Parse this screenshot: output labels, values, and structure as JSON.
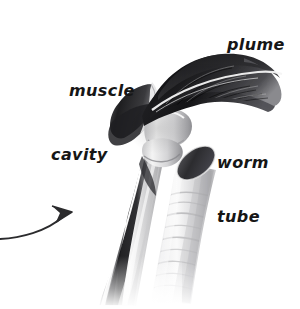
{
  "figure": {
    "kind": "pencil-illustration",
    "background_color": "#ffffff",
    "ink_color": "#161616",
    "width": 300,
    "height": 309
  },
  "labels": {
    "plume": "plume",
    "muscle": "muscle",
    "worm_tube_line1": "worm",
    "worm_tube_line2": "tube",
    "cavity": "cavity"
  },
  "icons": {
    "pointer": "curved-arrow-icon"
  },
  "parts": {
    "plume": {
      "name": "plume",
      "tone": "dark",
      "fill_dark": "#1d1d1f",
      "fill_mid": "#4a4a4d",
      "description": "dark feathery crown curving to the right"
    },
    "muscle": {
      "name": "muscle",
      "tone": "dark-mid",
      "fill_dark": "#2a2a2c",
      "fill_mid": "#6b6b6e",
      "description": "dark banded muscular collar below the plume"
    },
    "cavity": {
      "name": "cavity",
      "tone": "dark-streak",
      "fill_dark": "#242426",
      "description": "dark interior channel running down the worm body"
    },
    "worm_tube": {
      "name": "worm tube",
      "tone": "light",
      "fill_light": "#f2f2f2",
      "fill_shadow": "#b8b8ba",
      "opening_fill": "#3a3a3c",
      "description": "pale ringed cylinder with dark elliptical opening"
    },
    "body": {
      "name": "worm body",
      "fill_light": "#ededed",
      "fill_shadow": "#9a9a9c",
      "description": "pale sheathed body descending below the collar"
    }
  },
  "arrow": {
    "name": "curved-arrow",
    "color": "#2b2b2d",
    "tip_x": 74,
    "tip_y": 211,
    "tail_x": 0,
    "tail_y": 239
  }
}
